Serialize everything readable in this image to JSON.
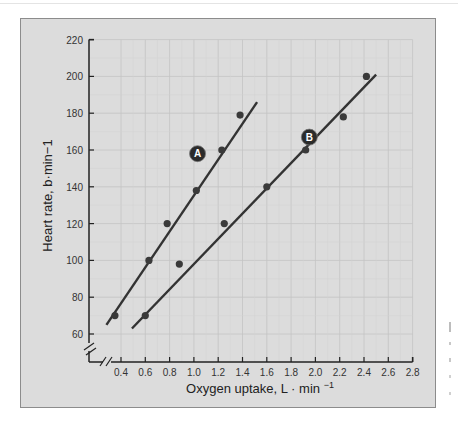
{
  "chart_data": {
    "type": "scatter",
    "title": "",
    "xlabel": "Oxygen uptake, L · min",
    "xlabel_exponent": "−1",
    "ylabel": "Heart rate, b·min−1",
    "xlim": [
      0.4,
      2.8
    ],
    "ylim": [
      60,
      220
    ],
    "x_ticks": [
      "0.4",
      "0.6",
      "0.8",
      "1.0",
      "1.2",
      "1.4",
      "1.6",
      "1.8",
      "2.0",
      "2.2",
      "2.4",
      "2.6",
      "2.8"
    ],
    "y_ticks": [
      "60",
      "80",
      "100",
      "120",
      "140",
      "160",
      "180",
      "200",
      "220"
    ],
    "grid": true,
    "axis_breaks": true,
    "series": [
      {
        "name": "A",
        "points": [
          [
            0.35,
            70
          ],
          [
            0.63,
            100
          ],
          [
            0.78,
            120
          ],
          [
            1.02,
            138
          ],
          [
            1.23,
            160
          ],
          [
            1.38,
            179
          ]
        ],
        "fit_line": [
          [
            0.28,
            65
          ],
          [
            1.52,
            186
          ]
        ],
        "label_position": [
          1.03,
          158
        ]
      },
      {
        "name": "B",
        "points": [
          [
            0.6,
            70
          ],
          [
            0.88,
            98
          ],
          [
            1.25,
            120
          ],
          [
            1.6,
            140
          ],
          [
            1.92,
            160
          ],
          [
            2.23,
            178
          ],
          [
            2.42,
            200
          ]
        ],
        "fit_line": [
          [
            0.49,
            63
          ],
          [
            2.5,
            201
          ]
        ],
        "label_position": [
          1.95,
          167
        ]
      }
    ]
  },
  "colors": {
    "panel_bg": "#dcdcdc",
    "grid": "#c4c4c4",
    "line": "#333333",
    "marker": "#3a3a3a",
    "label_badge": "#2b2b2b"
  }
}
